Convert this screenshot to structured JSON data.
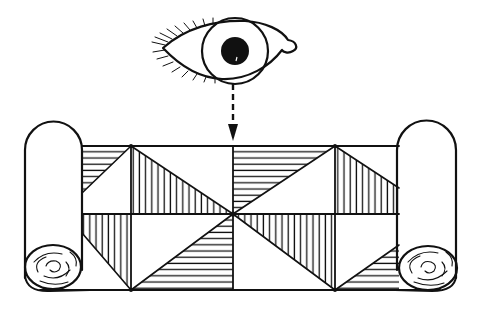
{
  "figure": {
    "description": "Line illustration of an eye looking down at an unrolled scroll/banner decorated with a hatched triangular quilt-like pattern",
    "ink_color": "#111111",
    "paper_color": "#ffffff",
    "elements": {
      "eye": {
        "label": "eye-icon"
      },
      "arrow": {
        "label": "dashed-arrow-down",
        "style": "dashed"
      },
      "scroll": {
        "label": "scroll",
        "left_roll": "rolled-end-left",
        "right_roll": "rolled-end-right",
        "pattern": "hatched-triangles",
        "columns": 4,
        "rows": 2
      }
    }
  }
}
